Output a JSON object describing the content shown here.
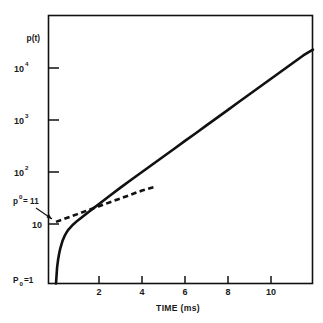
{
  "figure": {
    "background_color": "#ffffff",
    "line_color": "#111111",
    "frame_color": "#111111"
  },
  "axes": {
    "y_label": "p(t)",
    "x_label": "TIME (ms)",
    "y_scale": "log",
    "x_scale": "linear",
    "y_tick_labels": [
      "10",
      "10",
      "10",
      "10"
    ],
    "y_tick_exponents": [
      "4",
      "3",
      "2",
      ""
    ],
    "x_tick_labels": [
      "2",
      "4",
      "6",
      "8",
      "10"
    ]
  },
  "annotations": {
    "p_zero_superscript_label_base": "p",
    "p_zero_superscript_label_sup": "0",
    "p_zero_superscript_label_tail": " = 11",
    "p_initial_label_base": "P",
    "p_initial_label_sub": "0",
    "p_initial_label_tail": " =1"
  },
  "chart_data": {
    "type": "line",
    "title": "",
    "subtitle": "",
    "xlabel": "TIME (ms)",
    "ylabel": "p(t)",
    "xlim": [
      0,
      11.95
    ],
    "ylim": [
      1,
      100000
    ],
    "yscale": "log",
    "xscale": "linear",
    "grid": false,
    "legend": null,
    "xticks": [
      2,
      4,
      6,
      8,
      10
    ],
    "yticks": [
      10,
      100,
      1000,
      10000
    ],
    "ytick_text": [
      "10",
      "10^2",
      "10^3",
      "10^4"
    ],
    "annotations": [
      {
        "text": "p0 = 11",
        "value": 11,
        "note": "asymptote intercept of dashed line at t = 0"
      },
      {
        "text": "P0 =1",
        "value": 1,
        "note": "initial value of solid curve at t = 0"
      }
    ],
    "series": [
      {
        "name": "p(t) solid curve",
        "style": "solid",
        "x": [
          0.0,
          0.05,
          0.1,
          0.15,
          0.2,
          0.3,
          0.4,
          0.5,
          0.6,
          0.8,
          1.0,
          1.25,
          1.5,
          1.75,
          2.0,
          2.5,
          3.0,
          3.5,
          4.0,
          4.5,
          5.0,
          5.5,
          6.0,
          6.5,
          7.0,
          7.5,
          8.0,
          8.5,
          9.0,
          9.5,
          10.0,
          10.5,
          11.0,
          11.5,
          11.95
        ],
        "y": [
          1.0,
          1.45,
          2.1,
          2.75,
          3.4,
          4.7,
          5.9,
          7.0,
          8.0,
          9.8,
          11.6,
          14.0,
          16.8,
          20.2,
          24.3,
          35.0,
          50.0,
          71.0,
          100.0,
          141.0,
          199.0,
          280.0,
          396.0,
          558.0,
          788.0,
          1112.0,
          1568.0,
          2212.0,
          3121.0,
          4402.0,
          6210.0,
          8760.0,
          12360.0,
          17430.0,
          22600.0
        ]
      },
      {
        "name": "asymptote dashed line",
        "style": "dashed",
        "x": [
          0.0,
          1.0,
          2.0,
          3.0,
          4.0,
          4.6
        ],
        "y": [
          11.0,
          15.5,
          22.0,
          31.0,
          44.0,
          52.0
        ]
      }
    ]
  }
}
